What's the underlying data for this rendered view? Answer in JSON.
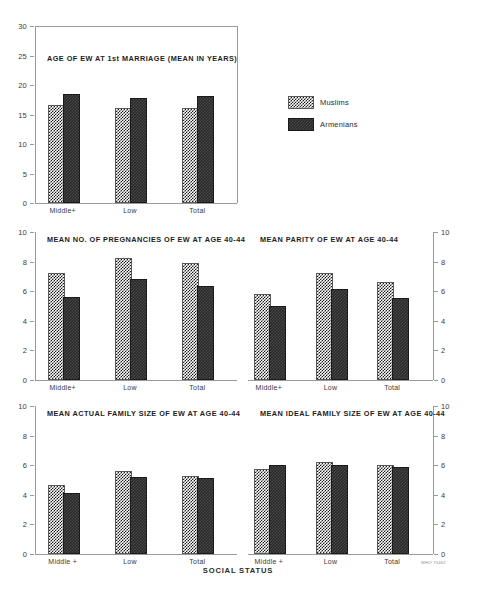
{
  "figure": {
    "xaxis_title": "SOCIAL STATUS",
    "credit": "WHO 75462"
  },
  "legend": {
    "entries": [
      {
        "label": "Muslims",
        "pattern": "light-checker",
        "color": "#ffffff"
      },
      {
        "label": "Armenians",
        "pattern": "dark-solid",
        "color": "#2a2a2a"
      }
    ]
  },
  "chart_data": [
    {
      "type": "bar",
      "panel": "top-left",
      "title": "AGE OF EW AT 1st MARRIAGE (MEAN IN YEARS)",
      "categories": [
        "Middle+",
        "Low",
        "Total"
      ],
      "series": [
        {
          "name": "Muslims",
          "values": [
            16.2,
            15.8,
            15.8
          ]
        },
        {
          "name": "Armenians",
          "values": [
            18.1,
            17.5,
            17.8
          ]
        }
      ],
      "xlabel": "SOCIAL STATUS",
      "ylabel": "",
      "ylim": [
        0,
        30
      ],
      "yticks": [
        0,
        5,
        10,
        15,
        20,
        25,
        30
      ],
      "yaxis_side": "left",
      "grid": false
    },
    {
      "type": "bar",
      "panel": "middle-left",
      "title": "MEAN NO. OF PREGNANCIES OF EW AT AGE 40-44",
      "categories": [
        "Middle+",
        "Low",
        "Total"
      ],
      "series": [
        {
          "name": "Muslims",
          "values": [
            7.1,
            8.1,
            7.75
          ]
        },
        {
          "name": "Armenians",
          "values": [
            5.45,
            6.7,
            6.2
          ]
        }
      ],
      "xlabel": "SOCIAL STATUS",
      "ylabel": "",
      "ylim": [
        0,
        10
      ],
      "yticks": [
        0,
        2,
        4,
        6,
        8,
        10
      ],
      "yaxis_side": "left",
      "grid": false
    },
    {
      "type": "bar",
      "panel": "middle-right",
      "title": "MEAN PARITY OF EW AT AGE 40-44",
      "categories": [
        "Middle+",
        "Low",
        "Total"
      ],
      "series": [
        {
          "name": "Muslims",
          "values": [
            5.7,
            7.1,
            6.5
          ]
        },
        {
          "name": "Armenians",
          "values": [
            4.85,
            6.0,
            5.4
          ]
        }
      ],
      "xlabel": "SOCIAL STATUS",
      "ylabel": "",
      "ylim": [
        0,
        10
      ],
      "yticks": [
        0,
        2,
        4,
        6,
        8,
        10
      ],
      "yaxis_side": "right",
      "grid": false
    },
    {
      "type": "bar",
      "panel": "bottom-left",
      "title": "MEAN ACTUAL FAMILY SIZE OF EW AT AGE 40-44",
      "categories": [
        "Middle +",
        "Low",
        "Total"
      ],
      "series": [
        {
          "name": "Muslims",
          "values": [
            4.55,
            5.5,
            5.15
          ]
        },
        {
          "name": "Armenians",
          "values": [
            4.0,
            5.1,
            5.0
          ]
        }
      ],
      "xlabel": "SOCIAL STATUS",
      "ylabel": "",
      "ylim": [
        0,
        10
      ],
      "yticks": [
        0,
        2,
        4,
        6,
        8,
        10
      ],
      "yaxis_side": "left",
      "grid": false
    },
    {
      "type": "bar",
      "panel": "bottom-right",
      "title": "MEAN IDEAL FAMILY SIZE OF EW AT AGE 40-44",
      "categories": [
        "Middle +",
        "Low",
        "Total"
      ],
      "series": [
        {
          "name": "Muslims",
          "values": [
            5.6,
            6.05,
            5.9
          ]
        },
        {
          "name": "Armenians",
          "values": [
            5.85,
            5.9,
            5.75
          ]
        }
      ],
      "xlabel": "SOCIAL STATUS",
      "ylabel": "",
      "ylim": [
        0,
        10
      ],
      "yticks": [
        0,
        2,
        4,
        6,
        8,
        10
      ],
      "yaxis_side": "right",
      "grid": false
    }
  ]
}
